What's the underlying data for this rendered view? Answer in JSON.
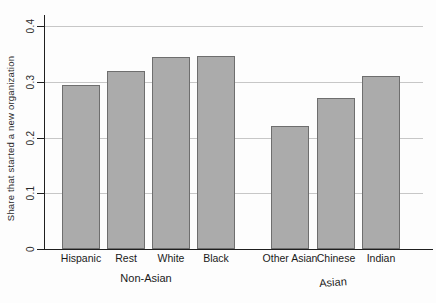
{
  "chart_data": {
    "type": "bar",
    "title": "",
    "ylabel": "Share that started a new organization",
    "xlabel": "",
    "ylim": [
      0,
      0.4
    ],
    "yticks": [
      0,
      0.1,
      0.2,
      0.3,
      0.4
    ],
    "ytick_labels": [
      "0",
      "0.1",
      "0.2",
      "0.3",
      "0.4"
    ],
    "grid": "horizontal gridlines at each y tick",
    "legend": "none",
    "categories": [
      "Hispanic",
      "Rest",
      "White",
      "Black",
      "Other Asian",
      "Chinese",
      "Indian"
    ],
    "values": [
      0.295,
      0.32,
      0.345,
      0.347,
      0.22,
      0.27,
      0.31
    ],
    "groups": [
      {
        "label": "Non-Asian",
        "categories": [
          "Hispanic",
          "Rest",
          "White",
          "Black"
        ],
        "values": [
          0.295,
          0.32,
          0.345,
          0.347
        ]
      },
      {
        "label": "Asian",
        "categories": [
          "Other Asian",
          "Chinese",
          "Indian"
        ],
        "values": [
          0.22,
          0.27,
          0.31
        ]
      }
    ],
    "colors": {
      "bar_fill": "#ababab",
      "bar_border": "#6e6e6e",
      "gridline": "#c7c7c7",
      "axis": "#1f1f1f",
      "text": "#1a1a1a",
      "background": "#fdfdfd"
    }
  }
}
